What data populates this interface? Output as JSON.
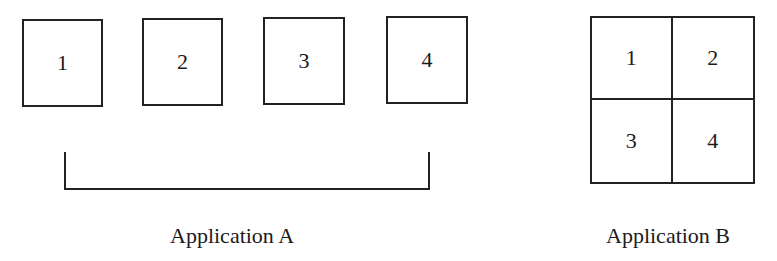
{
  "application_a": {
    "caption": "Application A",
    "boxes": [
      {
        "label": "1"
      },
      {
        "label": "2"
      },
      {
        "label": "3"
      },
      {
        "label": "4"
      }
    ]
  },
  "application_b": {
    "caption": "Application B",
    "cells": [
      {
        "label": "1"
      },
      {
        "label": "2"
      },
      {
        "label": "3"
      },
      {
        "label": "4"
      }
    ]
  }
}
